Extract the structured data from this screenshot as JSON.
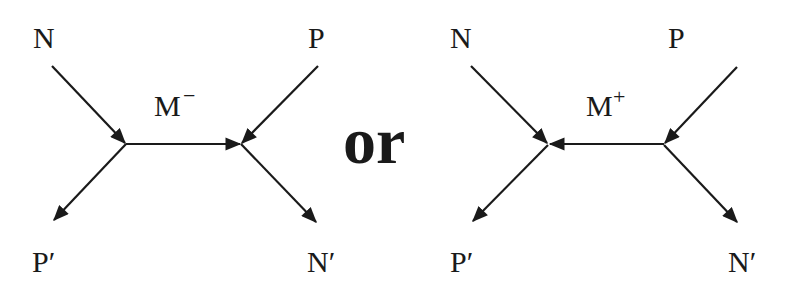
{
  "diagram": {
    "type": "feynman-like exchange diagram",
    "colors": {
      "ink": "#1a1a1a",
      "background": "#ffffff"
    },
    "left": {
      "labels": {
        "top_left": "N",
        "top_right": "P",
        "bottom_left": "P′",
        "bottom_right": "N′",
        "exchange": "M",
        "exchange_charge": "−"
      },
      "exchange_direction": "left-to-right"
    },
    "connector": "or",
    "right": {
      "labels": {
        "top_left": "N",
        "top_right": "P",
        "bottom_left": "P′",
        "bottom_right": "N′",
        "exchange": "M",
        "exchange_charge": "+"
      },
      "exchange_direction": "right-to-left"
    }
  }
}
